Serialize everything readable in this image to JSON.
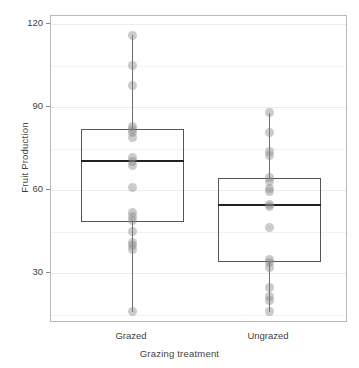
{
  "chart_data": {
    "type": "box",
    "title": "",
    "xlabel": "Grazing treatment",
    "ylabel": "Fruit Production",
    "ylim": [
      12,
      123
    ],
    "yticks": [
      30,
      60,
      90,
      120
    ],
    "ytick_labels": [
      "30",
      "60",
      "90",
      "120"
    ],
    "categories": [
      "Grazed",
      "Ungrazed"
    ],
    "grid": true,
    "legend": "none",
    "point_style": "overlaid grey jittered dots",
    "boxes": [
      {
        "category": "Grazed",
        "min": 16,
        "q1": 48.5,
        "median": 70.5,
        "q3": 82,
        "max": 116,
        "points": [
          116,
          105,
          98,
          83,
          82,
          81,
          79,
          72,
          70.5,
          69,
          61,
          52,
          50.5,
          49,
          45,
          41,
          40,
          38.5,
          16
        ]
      },
      {
        "category": "Ungrazed",
        "min": 16,
        "q1": 34,
        "median": 54.5,
        "q3": 64.5,
        "max": 88,
        "points": [
          88,
          81,
          74,
          72.5,
          64.5,
          63,
          60.5,
          59.5,
          55,
          54,
          46.5,
          35,
          34,
          32,
          25,
          21.5,
          20,
          16
        ]
      }
    ]
  },
  "axis": {
    "y_title": "Fruit Production",
    "x_title": "Grazing treatment"
  }
}
